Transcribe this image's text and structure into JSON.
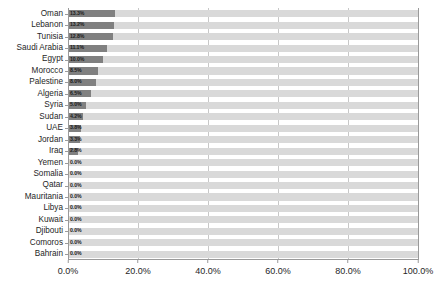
{
  "chart_data": {
    "type": "bar",
    "orientation": "horizontal",
    "title": "",
    "subtitle": "",
    "xlabel": "",
    "ylabel": "",
    "xlim": [
      0,
      100
    ],
    "grid": true,
    "legend": null,
    "value_suffix": "%",
    "colors": {
      "bar": "#808080",
      "track": "#d9d9d9",
      "gridline": "#c8c8c8",
      "axis": "#9a9a9a",
      "text": "#262626",
      "background": "#ffffff"
    },
    "categories": [
      "Oman",
      "Lebanon",
      "Tunisia",
      "Saudi Arabia",
      "Egypt",
      "Morocco",
      "Palestine",
      "Algeria",
      "Syria",
      "Sudan",
      "UAE",
      "Jordan",
      "Iraq",
      "Yemen",
      "Somalia",
      "Qatar",
      "Mauritania",
      "Libya",
      "Kuwait",
      "Djibouti",
      "Comoros",
      "Bahrain"
    ],
    "values": [
      13.3,
      13.2,
      12.8,
      11.1,
      10.0,
      8.5,
      8.0,
      6.5,
      5.0,
      4.2,
      3.8,
      3.3,
      2.8,
      0.0,
      0.0,
      0.0,
      0.0,
      0.0,
      0.0,
      0.0,
      0.0,
      0.0
    ],
    "data_labels": [
      "13.3%",
      "13.2%",
      "12.8%",
      "11.1%",
      "10.0%",
      "8.5%",
      "8.0%",
      "6.5%",
      "5.0%",
      "4.2%",
      "3.8%",
      "3.3%",
      "2.8%",
      "0.0%",
      "0.0%",
      "0.0%",
      "0.0%",
      "0.0%",
      "0.0%",
      "0.0%",
      "0.0%",
      "0.0%"
    ],
    "x_ticks": [
      0,
      20,
      40,
      60,
      80,
      100
    ],
    "x_tick_labels": [
      "0.0%",
      "20.0%",
      "40.0%",
      "60.0%",
      "80.0%",
      "100.0%"
    ]
  }
}
